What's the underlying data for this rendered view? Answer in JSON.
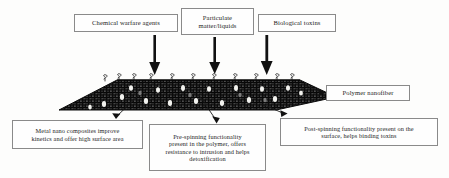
{
  "figure": {
    "kind": "functionalized-polymer-nanofiber-schematic",
    "threat_boxes": [
      {
        "id": "chemical-warfare-agents",
        "label": "Chemical warfare agents"
      },
      {
        "id": "particulate-matter-liquids",
        "line1": "Particulate",
        "line2": "matter/liquids"
      },
      {
        "id": "biological-toxins",
        "label": "Biological toxins"
      }
    ],
    "fiber_label": {
      "id": "polymer-nanofiber",
      "label": "Polymer nanofiber"
    },
    "annotations": [
      {
        "id": "metal-nano-composites",
        "line1": "Metal nano composites improve",
        "line2": "kinetics and offer high surface area"
      },
      {
        "id": "pre-spinning-functionality",
        "line1": "Pre-spinning functionality",
        "line2": "present in the polymer, offers",
        "line3": "resistance to intrusion and helps",
        "line4": "detoxification"
      },
      {
        "id": "post-spinning-functionality",
        "line1": "Post-spinning functionality present on the",
        "line2": "surface, helps binding toxins"
      }
    ],
    "arrows": {
      "count": 3,
      "direction": "down",
      "semantic": "threat-incidence-arrow"
    },
    "colors": {
      "fiber_body": "#2a2a2a",
      "nanoparticle": "#f4f4f0",
      "box_border": "#8a8a8a",
      "ink": "#1a1a1a",
      "page": "#fdfdfc"
    }
  }
}
